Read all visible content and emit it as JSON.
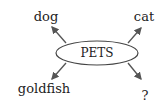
{
  "diagram": {
    "center": {
      "label": "PETS"
    },
    "branches": [
      {
        "label": "dog",
        "position": "top-left"
      },
      {
        "label": "cat",
        "position": "top-right"
      },
      {
        "label": "goldfish",
        "position": "bottom-left"
      },
      {
        "label": "?",
        "position": "bottom-right"
      }
    ]
  }
}
